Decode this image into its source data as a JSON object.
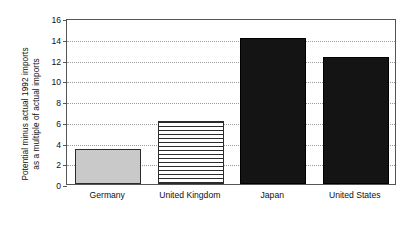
{
  "chart_data": {
    "type": "bar",
    "title": "",
    "subtitle": "",
    "xlabel": "",
    "ylabel": "Potential minus actual 1992 imports as a multiple of actual imports",
    "ylabel_lines": [
      "Potential minus actual 1992 imports",
      "as a multiple of actual imports"
    ],
    "categories": [
      "Germany",
      "United Kingdom",
      "Japan",
      "United States"
    ],
    "values": [
      3.4,
      6.1,
      14.1,
      12.2
    ],
    "ylim": [
      0,
      16
    ],
    "ytick_values": [
      0,
      2,
      4,
      6,
      8,
      10,
      12,
      14,
      16
    ],
    "ytick_labels": [
      "0",
      "2",
      "4",
      "6",
      "8",
      "10",
      "12",
      "14",
      "16"
    ],
    "grid": true,
    "grid_style": "dotted",
    "legend": false,
    "legend_position": "none",
    "bar_styles": [
      "solid-gray",
      "horizontal-hatch",
      "solid-black",
      "solid-black"
    ],
    "colors": {
      "bar_gray": "#c9c9c9",
      "bar_black": "#141414",
      "bar_outline": "#2b2b2b",
      "grid": "#9a9a9a",
      "frame": "#555555",
      "text": "#101010",
      "background": "#ffffff"
    }
  }
}
